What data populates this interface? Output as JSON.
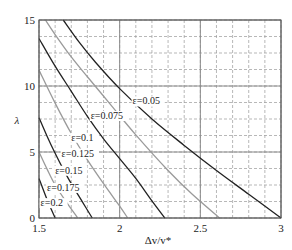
{
  "chart_data": {
    "type": "line",
    "title": "",
    "xlabel": "Δv/v*",
    "ylabel": "λ",
    "xlim": [
      1.5,
      3
    ],
    "ylim": [
      0,
      15
    ],
    "x_ticks": [
      "1.5",
      "2",
      "2.5",
      "3"
    ],
    "y_ticks": [
      "0",
      "5",
      "10",
      "15"
    ],
    "grid": {
      "major": true,
      "minor_dashed": true,
      "x_minor_step": 0.1,
      "y_minor_step": 1.25
    },
    "legend": "inline labels on curves",
    "series": [
      {
        "name": "ε=0.05",
        "label": "ε=0.05",
        "color": "#222222",
        "points": [
          [
            1.65,
            15
          ],
          [
            1.75,
            13.3
          ],
          [
            1.85,
            11.8
          ],
          [
            2.0,
            9.8
          ],
          [
            2.2,
            7.5
          ],
          [
            2.4,
            5.5
          ],
          [
            2.6,
            3.6
          ],
          [
            2.8,
            1.8
          ],
          [
            3.0,
            0
          ]
        ]
      },
      {
        "name": "ε=0.075",
        "label": "ε=0.075",
        "color": "#9a9a9a",
        "points": [
          [
            1.54,
            15
          ],
          [
            1.6,
            13.9
          ],
          [
            1.7,
            12.2
          ],
          [
            1.8,
            10.7
          ],
          [
            1.95,
            8.5
          ],
          [
            2.1,
            6.3
          ],
          [
            2.3,
            3.6
          ],
          [
            2.45,
            1.8
          ],
          [
            2.62,
            0
          ]
        ]
      },
      {
        "name": "ε=0.1",
        "label": "ε=0.1",
        "color": "#222222",
        "points": [
          [
            1.5,
            13.6
          ],
          [
            1.6,
            11.5
          ],
          [
            1.7,
            9.6
          ],
          [
            1.8,
            7.7
          ],
          [
            1.9,
            6.0
          ],
          [
            2.0,
            4.5
          ],
          [
            2.1,
            3.0
          ],
          [
            2.2,
            1.3
          ],
          [
            2.28,
            0
          ]
        ]
      },
      {
        "name": "ε=0.125",
        "label": "ε=0.125",
        "color": "#9a9a9a",
        "points": [
          [
            1.5,
            11.2
          ],
          [
            1.6,
            8.7
          ],
          [
            1.7,
            6.4
          ],
          [
            1.8,
            4.4
          ],
          [
            1.9,
            2.6
          ],
          [
            2.0,
            0.9
          ],
          [
            2.05,
            0
          ]
        ]
      },
      {
        "name": "ε=0.15",
        "label": "ε=0.15",
        "color": "#222222",
        "points": [
          [
            1.5,
            7.6
          ],
          [
            1.55,
            6.2
          ],
          [
            1.6,
            4.9
          ],
          [
            1.65,
            3.7
          ],
          [
            1.7,
            2.6
          ],
          [
            1.77,
            1.2
          ],
          [
            1.83,
            0
          ]
        ]
      },
      {
        "name": "ε=0.175",
        "label": "ε=0.175",
        "color": "#9a9a9a",
        "points": [
          [
            1.5,
            5.0
          ],
          [
            1.55,
            3.7
          ],
          [
            1.6,
            2.5
          ],
          [
            1.67,
            1.2
          ],
          [
            1.74,
            0
          ]
        ]
      },
      {
        "name": "ε=0.2",
        "label": "ε=0.2",
        "color": "#222222",
        "points": [
          [
            1.5,
            3.0
          ],
          [
            1.55,
            1.4
          ],
          [
            1.6,
            0
          ]
        ]
      }
    ],
    "annotations": [
      {
        "text": "ε=0.05",
        "x": 2.08,
        "y": 8.6
      },
      {
        "text": "ε=0.075",
        "x": 1.82,
        "y": 7.5
      },
      {
        "text": "ε=0.1",
        "x": 1.7,
        "y": 5.85
      },
      {
        "text": "ε=0.125",
        "x": 1.64,
        "y": 4.65
      },
      {
        "text": "ε=0.15",
        "x": 1.6,
        "y": 3.35
      },
      {
        "text": "ε=0.175",
        "x": 1.55,
        "y": 2.05
      },
      {
        "text": "ε=0.2",
        "x": 1.51,
        "y": 0.9
      }
    ]
  },
  "labels": {
    "x_axis": "Δv/v*",
    "y_axis": "λ"
  }
}
